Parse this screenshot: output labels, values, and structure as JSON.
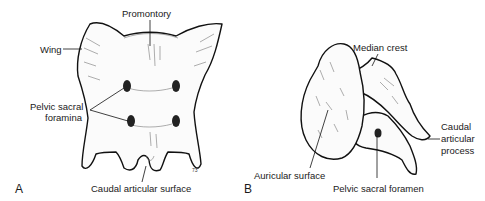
{
  "figure": {
    "panels": [
      {
        "id": "A",
        "letter": "A",
        "labels": {
          "promontory": "Promontory",
          "wing": "Wing",
          "pelvic_sacral_foramina_line1": "Pelvic sacral",
          "pelvic_sacral_foramina_line2": "foramina",
          "caudal_articular_surface": "Caudal articular surface"
        },
        "artist_mark": "73"
      },
      {
        "id": "B",
        "letter": "B",
        "labels": {
          "median_crest": "Median crest",
          "caudal_articular_process_line1": "Caudal",
          "caudal_articular_process_line2": "articular",
          "caudal_articular_process_line3": "process",
          "auricular_surface": "Auricular surface",
          "pelvic_sacral_foramen": "Pelvic sacral foramen"
        }
      }
    ]
  }
}
